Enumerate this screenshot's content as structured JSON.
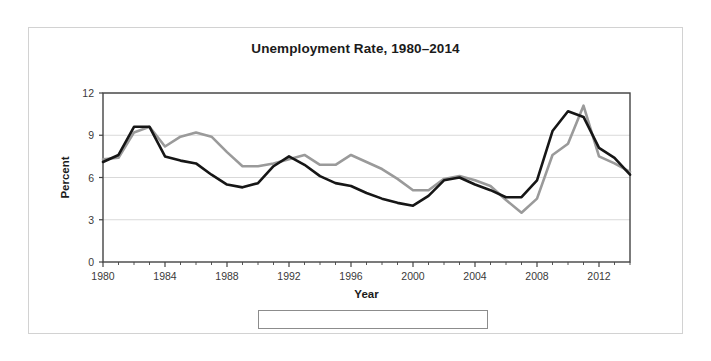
{
  "figure": {
    "title": "Unemployment Rate, 1980–2014",
    "background_color": "#ffffff",
    "frame_color": "#d2d2d2"
  },
  "chart_data": {
    "type": "line",
    "title": "Unemployment Rate, 1980–2014",
    "xlabel": "Year",
    "ylabel": "Percent",
    "xlim": [
      1980,
      2014
    ],
    "ylim": [
      0,
      12
    ],
    "yticks": [
      0,
      3,
      6,
      9,
      12
    ],
    "ytick_labels": [
      "0",
      "3",
      "6",
      "9",
      "12"
    ],
    "xticks": [
      1980,
      1984,
      1988,
      1992,
      1996,
      2000,
      2004,
      2008,
      2012
    ],
    "xtick_labels": [
      "1980",
      "1984",
      "1988",
      "1992",
      "1996",
      "2000",
      "2004",
      "2008",
      "2012"
    ],
    "minor_xtick_interval": 1,
    "grid": "horizontal",
    "grid_color": "#d9d9d9",
    "axis_color": "#444444",
    "legend_position": "below-center",
    "x": [
      1980,
      1981,
      1982,
      1983,
      1984,
      1985,
      1986,
      1987,
      1988,
      1989,
      1990,
      1991,
      1992,
      1993,
      1994,
      1995,
      1996,
      1997,
      1998,
      1999,
      2000,
      2001,
      2002,
      2003,
      2004,
      2005,
      2006,
      2007,
      2008,
      2009,
      2010,
      2011,
      2012,
      2013,
      2014
    ],
    "series": [
      {
        "name": "New Mexico",
        "color": "#9a9a9a",
        "width": 2.6,
        "values": [
          7.3,
          7.4,
          9.2,
          9.6,
          8.2,
          8.9,
          9.2,
          8.9,
          7.8,
          6.8,
          6.8,
          7.0,
          7.3,
          7.6,
          6.9,
          6.9,
          7.6,
          7.1,
          6.6,
          5.9,
          5.1,
          5.1,
          5.9,
          6.1,
          5.8,
          5.4,
          4.4,
          3.5,
          4.5,
          7.6,
          8.4,
          11.1,
          7.5,
          7.0,
          6.4
        ]
      },
      {
        "name": "United States",
        "color": "#161616",
        "width": 2.6,
        "values": [
          7.1,
          7.6,
          9.6,
          9.6,
          7.5,
          7.2,
          7.0,
          6.2,
          5.5,
          5.3,
          5.6,
          6.8,
          7.5,
          6.9,
          6.1,
          5.6,
          5.4,
          4.9,
          4.5,
          4.2,
          4.0,
          4.7,
          5.8,
          6.0,
          5.5,
          5.1,
          4.6,
          4.6,
          5.8,
          9.3,
          10.7,
          10.3,
          8.1,
          7.4,
          6.2
        ]
      }
    ]
  },
  "legend": {
    "items": [
      {
        "label": "New Mexico",
        "color": "#9a9a9a"
      },
      {
        "label": "United States",
        "color": "#161616"
      }
    ]
  }
}
